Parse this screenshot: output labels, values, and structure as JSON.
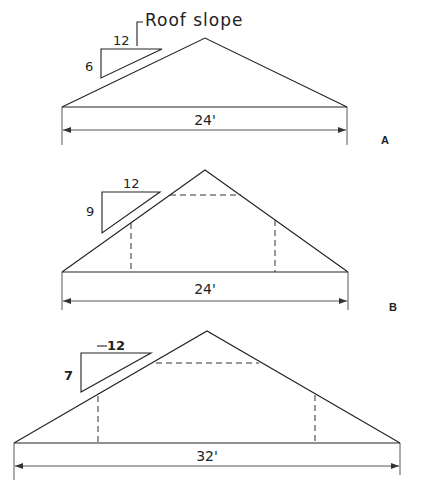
{
  "title": "Roof slope",
  "diagrams": [
    {
      "id": "A",
      "label": "A",
      "span": "24'",
      "slope": {
        "rise": "6",
        "run": "12"
      },
      "has_collar_ties": false
    },
    {
      "id": "B",
      "label": "B",
      "span": "24'",
      "slope": {
        "rise": "9",
        "run": "12"
      },
      "has_collar_ties": true
    },
    {
      "id": "C",
      "label": "",
      "span": "32'",
      "slope": {
        "rise": "7",
        "run": "12"
      },
      "has_collar_ties": true
    }
  ],
  "colors": {
    "line": "#222222",
    "background": "#ffffff"
  }
}
